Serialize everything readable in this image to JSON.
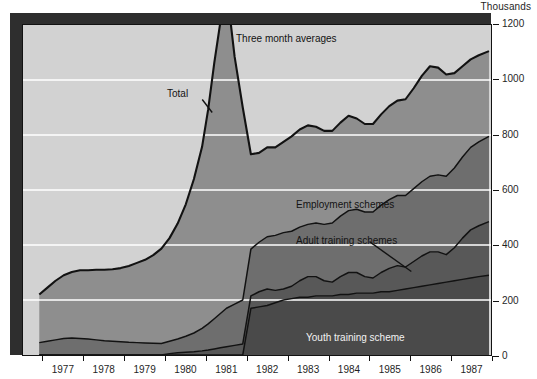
{
  "figure": {
    "units_label": "Thousands"
  },
  "chart_data": {
    "type": "area",
    "stacked": true,
    "title": "",
    "subtitle": "Three month averages",
    "xlabel": "",
    "ylabel": "Thousands",
    "ylim": [
      0,
      1200
    ],
    "yticks": [
      0,
      200,
      400,
      600,
      800,
      1000,
      1200
    ],
    "ytick_labels": [
      "0",
      "200",
      "400",
      "600",
      "800",
      "1000",
      "1200"
    ],
    "grid": "horizontal-white",
    "xlim": [
      1976.5,
      1988.0
    ],
    "xtick_labels": [
      "1977",
      "1978",
      "1979",
      "1980",
      "1981",
      "1982",
      "1983",
      "1984",
      "1985",
      "1986",
      "1987"
    ],
    "xtick_boundaries": [
      1977.0,
      1978.0,
      1979.0,
      1980.0,
      1981.0,
      1982.0,
      1983.0,
      1984.0,
      1985.0,
      1986.0,
      1987.0,
      1988.0
    ],
    "legend_position": "in-plot-annotations",
    "annotations": [
      {
        "name": "three-month-averages",
        "text": "Three month averages"
      },
      {
        "name": "total",
        "text": "Total",
        "has_leader_line": true
      },
      {
        "name": "employment-schemes",
        "text": "Employment schemes"
      },
      {
        "name": "adult-training-schemes",
        "text": "Adult training schemes",
        "has_leader_line": true
      },
      {
        "name": "youth-training-scheme",
        "text": "Youth training scheme"
      }
    ],
    "colors": {
      "plot_background": "#d2d2d2",
      "total_band": "#8e8e8e",
      "employment_band": "#6e6e6e",
      "adult_band": "#585858",
      "youth_band": "#4a4a4a",
      "gridline": "#ffffff",
      "outline": "#121212",
      "shadow": "#2e2e2e"
    },
    "x": [
      1976.9,
      1977.1,
      1977.3,
      1977.5,
      1977.7,
      1977.9,
      1978.1,
      1978.3,
      1978.5,
      1978.7,
      1978.9,
      1979.1,
      1979.3,
      1979.5,
      1979.7,
      1979.9,
      1980.1,
      1980.3,
      1980.5,
      1980.7,
      1980.9,
      1981.05,
      1981.2,
      1981.35,
      1981.5,
      1981.7,
      1981.9,
      1982.1,
      1982.3,
      1982.5,
      1982.7,
      1982.9,
      1983.1,
      1983.3,
      1983.5,
      1983.7,
      1983.9,
      1984.1,
      1984.3,
      1984.5,
      1984.7,
      1984.9,
      1985.1,
      1985.3,
      1985.5,
      1985.7,
      1985.9,
      1986.1,
      1986.3,
      1986.5,
      1986.7,
      1986.9,
      1987.1,
      1987.3,
      1987.5,
      1987.7,
      1987.95
    ],
    "series": [
      {
        "name": "Youth training scheme",
        "color": "#4a4a4a",
        "values": [
          0,
          0,
          0,
          0,
          0,
          0,
          0,
          0,
          0,
          0,
          0,
          0,
          0,
          0,
          0,
          0,
          0,
          0,
          0,
          0,
          0,
          0,
          0,
          0,
          0,
          0,
          0,
          170,
          175,
          180,
          190,
          200,
          205,
          210,
          210,
          215,
          215,
          215,
          220,
          220,
          225,
          225,
          225,
          230,
          230,
          235,
          240,
          245,
          250,
          255,
          260,
          265,
          270,
          275,
          280,
          285,
          290
        ]
      },
      {
        "name": "Adult training schemes",
        "color": "#585858",
        "values": [
          0,
          0,
          0,
          0,
          0,
          0,
          0,
          0,
          0,
          0,
          0,
          0,
          0,
          0,
          0,
          0,
          5,
          8,
          10,
          12,
          15,
          18,
          22,
          26,
          30,
          35,
          40,
          45,
          55,
          60,
          45,
          40,
          45,
          60,
          75,
          70,
          55,
          50,
          65,
          80,
          75,
          60,
          55,
          70,
          85,
          90,
          80,
          95,
          110,
          120,
          115,
          100,
          120,
          150,
          175,
          185,
          195
        ]
      },
      {
        "name": "Employment schemes",
        "color": "#6e6e6e",
        "values": [
          45,
          50,
          55,
          60,
          62,
          60,
          58,
          55,
          52,
          50,
          48,
          46,
          45,
          44,
          43,
          42,
          45,
          50,
          58,
          68,
          82,
          95,
          110,
          125,
          140,
          150,
          160,
          170,
          180,
          190,
          200,
          205,
          200,
          195,
          190,
          195,
          205,
          215,
          220,
          225,
          230,
          235,
          240,
          245,
          250,
          255,
          260,
          265,
          270,
          275,
          280,
          285,
          290,
          295,
          300,
          305,
          310
        ]
      },
      {
        "name": "Total",
        "color": "#8e8e8e",
        "description": "Claimant/registered unemployment above the scheme bands",
        "values": [
          175,
          195,
          215,
          230,
          240,
          248,
          250,
          255,
          258,
          262,
          268,
          278,
          290,
          302,
          320,
          345,
          375,
          420,
          480,
          560,
          660,
          780,
          930,
          1060,
          1170,
          900,
          700,
          345,
          325,
          325,
          320,
          330,
          345,
          355,
          360,
          350,
          340,
          335,
          340,
          345,
          330,
          320,
          320,
          330,
          340,
          345,
          350,
          365,
          385,
          400,
          390,
          370,
          345,
          330,
          320,
          315,
          310
        ]
      }
    ],
    "total_line": {
      "name": "Total",
      "description": "Top outline of the stacked area = total",
      "values": [
        220,
        245,
        270,
        290,
        302,
        308,
        308,
        310,
        310,
        312,
        316,
        324,
        335,
        346,
        363,
        387,
        425,
        478,
        548,
        640,
        757,
        893,
        1062,
        1211,
        1340,
        1085,
        900,
        730,
        735,
        755,
        755,
        775,
        795,
        820,
        835,
        830,
        815,
        815,
        845,
        870,
        860,
        840,
        840,
        875,
        905,
        925,
        930,
        970,
        1015,
        1050,
        1045,
        1020,
        1025,
        1050,
        1075,
        1090,
        1105
      ]
    },
    "peak": {
      "label": "Total peak",
      "x": 1981.5,
      "value": 1170
    }
  }
}
